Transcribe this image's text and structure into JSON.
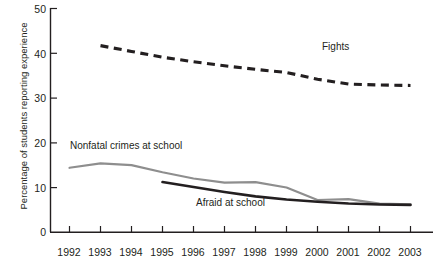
{
  "chart_data": {
    "type": "line",
    "title": "",
    "xlabel": "",
    "ylabel": "Percentage of students reporting experience",
    "xlim": [
      1991.6,
      2003.8
    ],
    "ylim": [
      0,
      50
    ],
    "yticks": [
      0,
      10,
      20,
      30,
      40,
      50
    ],
    "ytick_labels": [
      "0",
      "10",
      "20",
      "30",
      "40",
      "50"
    ],
    "x": [
      1992,
      1993,
      1994,
      1995,
      1996,
      1997,
      1998,
      1999,
      2000,
      2001,
      2002,
      2003
    ],
    "xtick_labels": [
      "1992",
      "1993",
      "1994",
      "1995",
      "1996",
      "1997",
      "1998",
      "1999",
      "2000",
      "2001",
      "2002",
      "2003"
    ],
    "grid": false,
    "legend_position": "inline-annotations",
    "series": [
      {
        "name": "Fights",
        "label": "Fights",
        "style": "dashed",
        "color": "#231f20",
        "x": [
          1993,
          1994,
          1995,
          1996,
          1997,
          1998,
          1999,
          2000,
          2001,
          2002,
          2003
        ],
        "values": [
          41.7,
          40.4,
          39.1,
          38.1,
          37.2,
          36.4,
          35.7,
          34.2,
          33.1,
          32.9,
          32.8
        ]
      },
      {
        "name": "Nonfatal crimes at school",
        "label": "Nonfatal crimes at school",
        "style": "solid",
        "color": "#8e8e8e",
        "x": [
          1992,
          1993,
          1994,
          1995,
          1996,
          1997,
          1998,
          1999,
          2000,
          2001,
          2002,
          2003
        ],
        "values": [
          14.4,
          15.4,
          15.0,
          13.4,
          12.0,
          11.1,
          11.2,
          10.0,
          7.2,
          7.4,
          6.4,
          6.2
        ]
      },
      {
        "name": "Afraid at school",
        "label": "Afraid at school",
        "style": "solid-bold",
        "color": "#231f20",
        "x": [
          1995,
          1996,
          1997,
          1998,
          1999,
          2000,
          2001,
          2002,
          2003
        ],
        "values": [
          11.2,
          10.1,
          9.0,
          8.0,
          7.3,
          6.8,
          6.4,
          6.2,
          6.1
        ]
      }
    ],
    "annotations": [
      {
        "text": "Fights",
        "x_px": 322,
        "y_px": 47
      },
      {
        "text": "Nonfatal crimes at school",
        "x_px": 70,
        "y_px": 146
      },
      {
        "text": "Afraid at school",
        "x_px": 196,
        "y_px": 203
      }
    ]
  }
}
